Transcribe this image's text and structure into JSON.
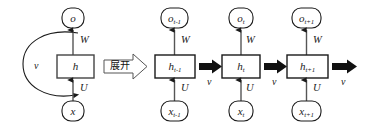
{
  "figure": {
    "background_color": "#ffffff",
    "stroke_color": "#1a1a1a",
    "box_fill": "#ffffff",
    "thick_arrow_color": "#111111"
  },
  "folded": {
    "output_node": {
      "label": "o",
      "sub": ""
    },
    "hidden_node": {
      "label": "h",
      "sub": ""
    },
    "input_node": {
      "label": "x",
      "sub": ""
    },
    "weight_output": "W",
    "weight_input": "U",
    "recurrent_label": "v"
  },
  "unfold_arrow": {
    "label": "展开"
  },
  "timesteps": [
    {
      "output_node": {
        "label": "o",
        "sub": "t-1"
      },
      "hidden_node": {
        "label": "h",
        "sub": "t-1"
      },
      "input_node": {
        "label": "x",
        "sub": "t-1"
      },
      "weight_output": "W",
      "weight_input": "U",
      "recurrent_label": "v"
    },
    {
      "output_node": {
        "label": "o",
        "sub": "t"
      },
      "hidden_node": {
        "label": "h",
        "sub": "t"
      },
      "input_node": {
        "label": "x",
        "sub": "t"
      },
      "weight_output": "W",
      "weight_input": "U",
      "recurrent_label": "v"
    },
    {
      "output_node": {
        "label": "o",
        "sub": "t+1"
      },
      "hidden_node": {
        "label": "h",
        "sub": "t+1"
      },
      "input_node": {
        "label": "x",
        "sub": "t+1"
      },
      "weight_output": "W",
      "weight_input": "U",
      "recurrent_label": "v"
    }
  ],
  "trailing_arrow": {
    "recurrent_label": "v"
  }
}
